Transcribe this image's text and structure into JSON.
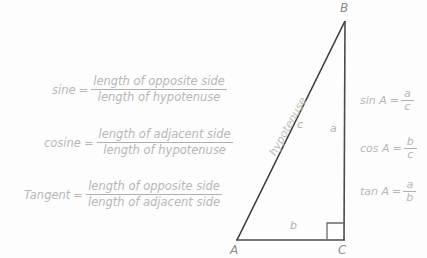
{
  "diagram": {
    "colors": {
      "background": "#fdfdfd",
      "stroke": "#3a3a3a",
      "text_light": "#b7b7b7",
      "text_vertex": "#8d8d8d"
    },
    "definitions": [
      {
        "name": "sine",
        "equals": "=",
        "numerator": "length of opposite side",
        "denominator": "length of hypotenuse"
      },
      {
        "name": "cosine",
        "equals": "=",
        "numerator": "length of adjacent side",
        "denominator": "length of hypotenuse"
      },
      {
        "name": "Tangent",
        "equals": "=",
        "numerator": "length of opposite side",
        "denominator": "length of adjacent side"
      }
    ],
    "ratios": [
      {
        "name": "sin A",
        "equals": "=",
        "numerator": "a",
        "denominator": "c"
      },
      {
        "name": "cos A",
        "equals": "=",
        "numerator": "b",
        "denominator": "c"
      },
      {
        "name": "tan A",
        "equals": "=",
        "numerator": "a",
        "denominator": "b"
      }
    ],
    "triangle": {
      "vertices": [
        {
          "label": "B",
          "x": 345,
          "y": 20
        },
        {
          "label": "A",
          "x": 237,
          "y": 240
        },
        {
          "label": "C",
          "x": 344,
          "y": 240
        }
      ],
      "sides": [
        {
          "label": "a",
          "description": "opposite side (vertical, B to C)"
        },
        {
          "label": "b",
          "description": "adjacent side (base, A to C)"
        },
        {
          "label": "c",
          "description": "hypotenuse (A to B)"
        }
      ],
      "hypotenuse_label": "hypotenuse",
      "right_angle_vertex": "C"
    }
  }
}
